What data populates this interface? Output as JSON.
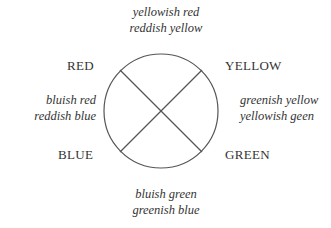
{
  "diagram": {
    "primaries": {
      "top_left": "RED",
      "top_right": "YELLOW",
      "bottom_left": "BLUE",
      "bottom_right": "GREEN"
    },
    "mixtures": {
      "top": [
        "yellowish red",
        "reddish yellow"
      ],
      "left": [
        "bluish red",
        "reddish blue"
      ],
      "right": [
        "greenish yellow",
        "yellowish geen"
      ],
      "bottom": [
        "bluish green",
        "greenish blue"
      ]
    },
    "stroke_color": "#555555",
    "text_color": "#333333"
  }
}
